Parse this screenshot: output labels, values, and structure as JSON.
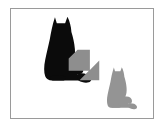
{
  "figure": {
    "caption": "",
    "background_color": "#ffffff",
    "panel": {
      "background_color": "#ffffff",
      "border_color": "#9a9a9a",
      "border_width_px": 1
    }
  },
  "objects": {
    "source_cat": {
      "name": "black-cat-silhouette",
      "label": "",
      "color": "#0b0b0b",
      "position": "upper-left",
      "relative_size": "large",
      "pose": "sitting, facing left"
    },
    "arrow": {
      "name": "transformation-arrow",
      "label": "",
      "color": "#8e8e8e",
      "direction": "down-right",
      "angle_degrees": 45,
      "style": "block arrow"
    },
    "target_cat": {
      "name": "gray-cat-silhouette",
      "label": "",
      "color": "#949494",
      "position": "lower-right",
      "relative_size": "small",
      "pose": "sitting, facing left"
    }
  },
  "colors": {
    "black": "#0b0b0b",
    "gray_arrow": "#8e8e8e",
    "gray_cat": "#949494",
    "frame": "#9a9a9a",
    "white": "#ffffff"
  }
}
